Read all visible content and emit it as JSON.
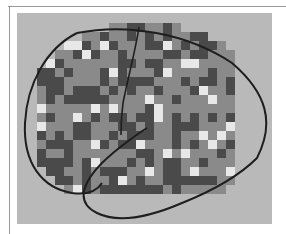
{
  "figure": {
    "kind": "grayscale brain map scan",
    "colors": {
      "panel_bg": "#b9b9b9",
      "outline": "#1e1e1e",
      "dark_cell": "#4a4a4a",
      "mid_cell": "#8a8a8a",
      "light_cell": "#e8e8e8"
    },
    "grid": {
      "cols": 22,
      "rows": 19,
      "cell_px": 9
    }
  }
}
